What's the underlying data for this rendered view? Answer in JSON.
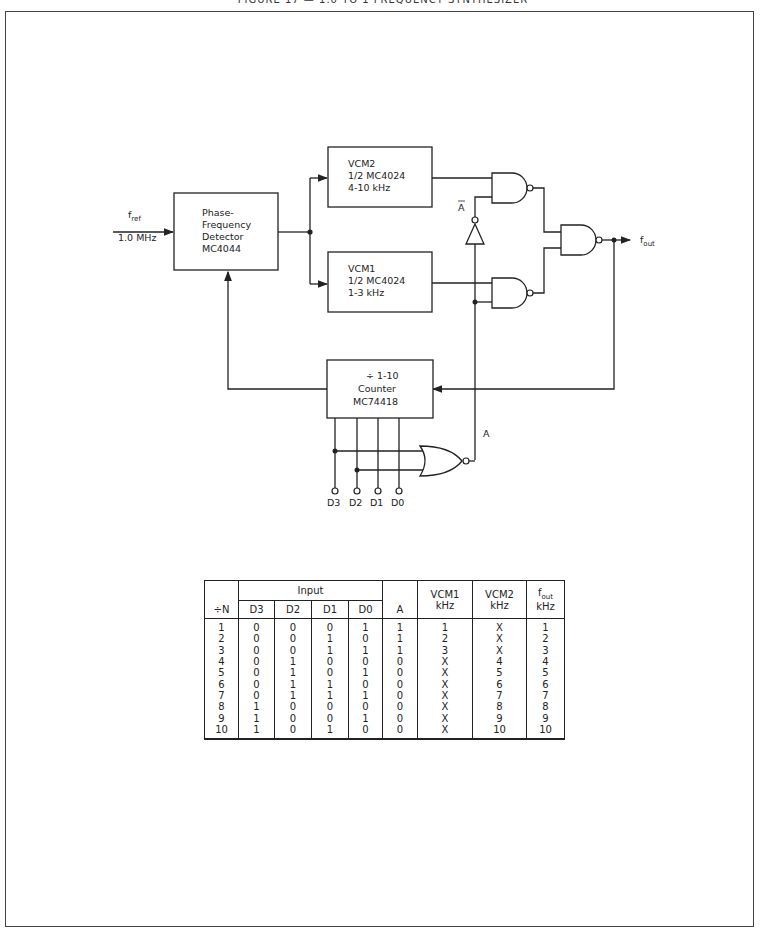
{
  "page": {
    "title": "FIGURE 17 — 1.0 TO 1 FREQUENCY SYNTHESIZER"
  },
  "diagram": {
    "input": {
      "label": "f",
      "label_sub": "ref",
      "value": "1.0 MHz"
    },
    "output": {
      "label": "f",
      "label_sub": "out"
    },
    "blocks": {
      "pfd": {
        "lines": [
          "Phase-",
          "Frequency",
          "Detector",
          "MC4044"
        ]
      },
      "vcm2": {
        "lines": [
          "VCM2",
          "1/2 MC4024",
          "4-10 kHz"
        ]
      },
      "vcm1": {
        "lines": [
          "VCM1",
          "1/2 MC4024",
          "1-3 kHz"
        ]
      },
      "counter": {
        "lines": [
          "÷ 1-10",
          "Counter",
          "MC74418"
        ]
      }
    },
    "signals": {
      "a": "A",
      "a_bar": "A"
    },
    "pins": [
      "D3",
      "D2",
      "D1",
      "D0"
    ]
  },
  "table": {
    "headers": {
      "n": "÷N",
      "input_group": "Input",
      "inputs": [
        "D3",
        "D2",
        "D1",
        "D0"
      ],
      "a": "A",
      "vcm1": [
        "VCM1",
        "kHz"
      ],
      "vcm2": [
        "VCM2",
        "kHz"
      ],
      "fout": [
        "f",
        "out",
        "kHz"
      ]
    },
    "rows": [
      {
        "n": "1",
        "d3": "0",
        "d2": "0",
        "d1": "0",
        "d0": "1",
        "a": "1",
        "vcm1": "1",
        "vcm2": "X",
        "fout": "1"
      },
      {
        "n": "2",
        "d3": "0",
        "d2": "0",
        "d1": "1",
        "d0": "0",
        "a": "1",
        "vcm1": "2",
        "vcm2": "X",
        "fout": "2"
      },
      {
        "n": "3",
        "d3": "0",
        "d2": "0",
        "d1": "1",
        "d0": "1",
        "a": "1",
        "vcm1": "3",
        "vcm2": "X",
        "fout": "3"
      },
      {
        "n": "4",
        "d3": "0",
        "d2": "1",
        "d1": "0",
        "d0": "0",
        "a": "0",
        "vcm1": "X",
        "vcm2": "4",
        "fout": "4"
      },
      {
        "n": "5",
        "d3": "0",
        "d2": "1",
        "d1": "0",
        "d0": "1",
        "a": "0",
        "vcm1": "X",
        "vcm2": "5",
        "fout": "5"
      },
      {
        "n": "6",
        "d3": "0",
        "d2": "1",
        "d1": "1",
        "d0": "0",
        "a": "0",
        "vcm1": "X",
        "vcm2": "6",
        "fout": "6"
      },
      {
        "n": "7",
        "d3": "0",
        "d2": "1",
        "d1": "1",
        "d0": "1",
        "a": "0",
        "vcm1": "X",
        "vcm2": "7",
        "fout": "7"
      },
      {
        "n": "8",
        "d3": "1",
        "d2": "0",
        "d1": "0",
        "d0": "0",
        "a": "0",
        "vcm1": "X",
        "vcm2": "8",
        "fout": "8"
      },
      {
        "n": "9",
        "d3": "1",
        "d2": "0",
        "d1": "0",
        "d0": "1",
        "a": "0",
        "vcm1": "X",
        "vcm2": "9",
        "fout": "9"
      },
      {
        "n": "10",
        "d3": "1",
        "d2": "0",
        "d1": "1",
        "d0": "0",
        "a": "0",
        "vcm1": "X",
        "vcm2": "10",
        "fout": "10"
      }
    ]
  }
}
